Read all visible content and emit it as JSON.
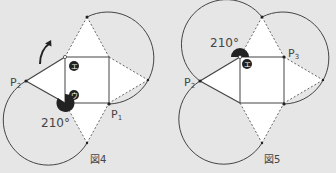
{
  "figures": [
    {
      "caption": "図4",
      "angle_label": "210°",
      "points": {
        "p1": "P",
        "p1_sub": "1",
        "p2": "P",
        "p2_sub": "2"
      },
      "markers": [
        "エ",
        "ウ"
      ]
    },
    {
      "caption": "図5",
      "angle_label": "210°",
      "points": {
        "p2": "P",
        "p2_sub": "2",
        "p3": "P",
        "p3_sub": "3"
      },
      "markers": [
        "エ"
      ]
    }
  ],
  "colors": {
    "background": "#e6e6e6",
    "line": "#444444",
    "fill": "#ffffff",
    "marker": "#222222"
  }
}
